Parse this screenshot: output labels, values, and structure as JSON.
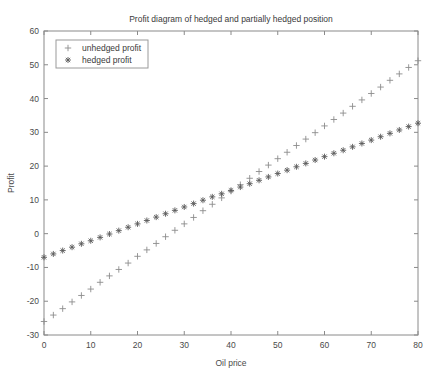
{
  "chart_data": {
    "type": "scatter",
    "title": "Profit diagram of hedged and partially hedged position",
    "xlabel": "Oil price",
    "ylabel": "Profit",
    "xlim": [
      0,
      80
    ],
    "ylim": [
      -30,
      60
    ],
    "xticks": [
      0,
      10,
      20,
      30,
      40,
      50,
      60,
      70,
      80
    ],
    "yticks": [
      -30,
      -20,
      -10,
      0,
      10,
      20,
      30,
      40,
      50,
      60
    ],
    "grid": false,
    "legend_position": "top-left",
    "series": [
      {
        "name": "unhedged profit",
        "marker": "plus",
        "color": "#8c8c8c",
        "x": [
          0,
          2,
          4,
          6,
          8,
          10,
          12,
          14,
          16,
          18,
          20,
          22,
          24,
          26,
          28,
          30,
          32,
          34,
          36,
          38,
          40,
          42,
          44,
          46,
          48,
          50,
          52,
          54,
          56,
          58,
          60,
          62,
          64,
          66,
          68,
          70,
          72,
          74,
          76,
          78,
          80
        ],
        "values": [
          -26.0,
          -24.1,
          -22.2,
          -20.2,
          -18.3,
          -16.4,
          -14.4,
          -12.5,
          -10.6,
          -8.7,
          -6.7,
          -4.8,
          -2.9,
          -0.9,
          1.0,
          2.9,
          4.8,
          6.8,
          8.7,
          10.6,
          12.6,
          14.5,
          16.4,
          18.4,
          20.3,
          22.2,
          24.1,
          26.1,
          28.0,
          29.9,
          31.9,
          33.8,
          35.7,
          37.7,
          39.6,
          41.5,
          43.4,
          45.4,
          47.3,
          49.2,
          51.2
        ]
      },
      {
        "name": "hedged profit",
        "marker": "star",
        "color": "#5a5a5a",
        "x": [
          0,
          2,
          4,
          6,
          8,
          10,
          12,
          14,
          16,
          18,
          20,
          22,
          24,
          26,
          28,
          30,
          32,
          34,
          36,
          38,
          40,
          42,
          44,
          46,
          48,
          50,
          52,
          54,
          56,
          58,
          60,
          62,
          64,
          66,
          68,
          70,
          72,
          74,
          76,
          78,
          80
        ],
        "values": [
          -7.0,
          -6.0,
          -5.0,
          -4.0,
          -3.0,
          -2.1,
          -1.1,
          -0.1,
          0.9,
          1.9,
          2.9,
          3.9,
          4.9,
          5.9,
          6.9,
          7.9,
          8.9,
          9.9,
          10.9,
          11.8,
          12.8,
          13.8,
          14.8,
          15.8,
          16.8,
          17.8,
          18.8,
          19.8,
          20.8,
          21.8,
          22.8,
          23.8,
          24.7,
          25.7,
          26.7,
          27.7,
          28.7,
          29.7,
          30.7,
          31.7,
          32.7
        ]
      }
    ]
  },
  "legend": {
    "entries": [
      {
        "label": "unhedged profit"
      },
      {
        "label": "hedged profit"
      }
    ]
  }
}
